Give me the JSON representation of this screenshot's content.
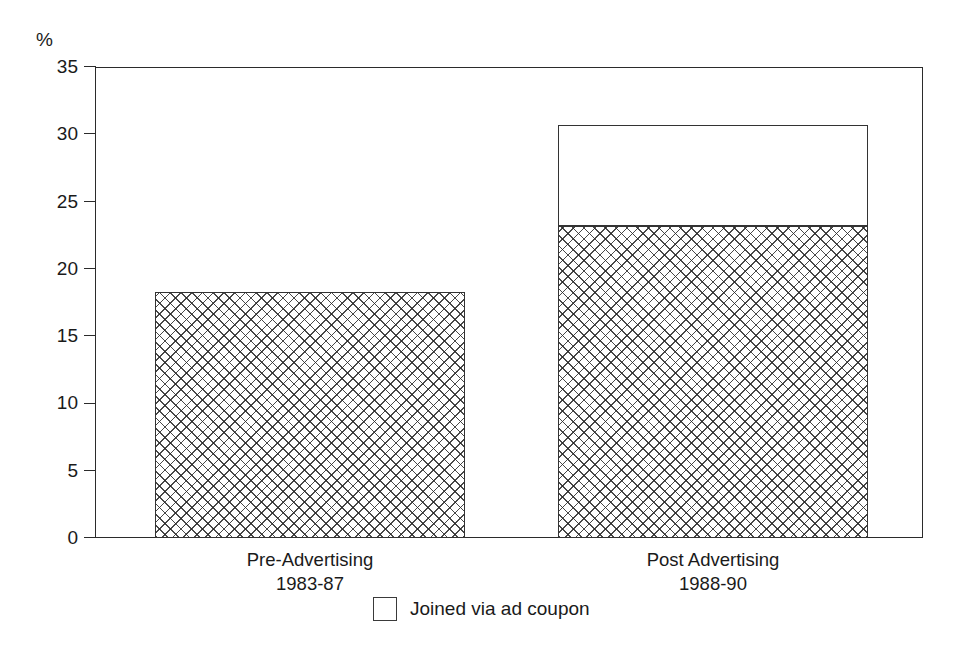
{
  "chart_data": {
    "type": "bar",
    "title": "",
    "subtitle": "",
    "xlabel": "",
    "ylabel": "%",
    "ylim": [
      0,
      35
    ],
    "yticks": [
      0,
      5,
      10,
      15,
      20,
      25,
      30,
      35
    ],
    "ytick_labels": [
      "0",
      "5",
      "10",
      "15",
      "20",
      "25",
      "30",
      "35"
    ],
    "grid": false,
    "stacked": true,
    "legend_position": "bottom-center",
    "categories": [
      "Pre-Advertising\n1983-87",
      "Post Advertising\n1988-90"
    ],
    "category_lines": [
      {
        "line1": "Pre-Advertising",
        "line2": "1983-87"
      },
      {
        "line1": "Post Advertising",
        "line2": "1988-90"
      }
    ],
    "series": [
      {
        "name": "Joined by other means",
        "fill": "crosshatch",
        "values": [
          18.3,
          23.2
        ]
      },
      {
        "name": "Joined via ad coupon",
        "fill": "white",
        "values": [
          0,
          7.5
        ]
      }
    ],
    "bar_totals": [
      18.3,
      30.7
    ],
    "legend": [
      {
        "label": "Joined via ad coupon",
        "swatch": "white-square"
      }
    ],
    "annotations": []
  },
  "axis": {
    "unit_label": "%"
  },
  "colors": {
    "ink": "#1a1a1a",
    "axis": "#2b2b2b",
    "bar_outline": "#333333",
    "hatch": "#282828",
    "background": "#ffffff"
  }
}
